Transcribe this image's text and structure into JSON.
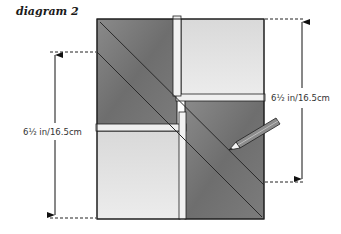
{
  "title": "diagram 2",
  "dimensions": {
    "right_label": "6½ in/16.5cm",
    "left_label": "6½ in/16.5cm"
  },
  "colors": {
    "dark_fabric": "#7a7a7a",
    "light_fabric": "#e6e6e6",
    "seam_allowance": "#efefef",
    "outline": "#1e1e1e",
    "pencil": "#8c8c8c"
  },
  "components": {
    "quilt_block": "Four-patch block with two dark and two light squares, offset seams",
    "diagonal_lines": "Two parallel diagonal stitching lines across dark squares",
    "pencil": "pencil-icon"
  }
}
